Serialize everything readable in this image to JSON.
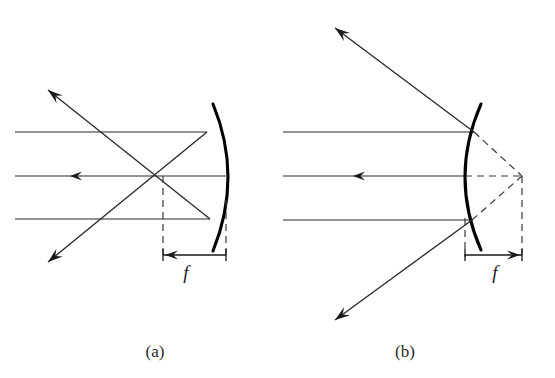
{
  "figure": {
    "background_color": "#ffffff",
    "ink_color": "#1a1a1a",
    "width": 555,
    "height": 378
  },
  "panels": [
    {
      "id": "a",
      "caption": "(a)",
      "caption_x": 155,
      "caption_y": 357,
      "mirror_type": "concave",
      "focal_label": "f",
      "focal_label_x": 186,
      "focal_label_y": 279,
      "focus_x": 163,
      "focus_y": 176,
      "vertex_x": 226,
      "vertex_y": 176,
      "mirror_top": {
        "x": 213,
        "y": 104
      },
      "mirror_bottom": {
        "x": 213,
        "y": 251
      },
      "mirror_control": {
        "x": 243,
        "y": 177
      },
      "axis_y": 176,
      "ray_start_x": 15,
      "incoming_rays": [
        {
          "y": 132,
          "hit_x": 207,
          "hit_y": 132
        },
        {
          "y": 176,
          "hit_x": 226,
          "hit_y": 176
        },
        {
          "y": 219,
          "hit_x": 210,
          "hit_y": 219
        }
      ],
      "incoming_arrow": {
        "x": 70,
        "y": 176,
        "direction": "left"
      },
      "reflected_rays": [
        {
          "from_x": 207,
          "from_y": 132,
          "to_x": 48,
          "to_y": 262,
          "arrow": "lower-left"
        },
        {
          "from_x": 210,
          "from_y": 219,
          "to_x": 48,
          "to_y": 90,
          "arrow": "upper-left"
        }
      ],
      "dimension": {
        "left_x": 163,
        "right_x": 226,
        "y": 255,
        "arrow_direction": "left",
        "dash_top_left_y": 176,
        "dash_top_right_y": 200
      }
    },
    {
      "id": "b",
      "caption": "(b)",
      "caption_x": 405,
      "caption_y": 357,
      "mirror_type": "convex",
      "focal_label": "f",
      "focal_label_x": 495,
      "focal_label_y": 279,
      "focus_x": 522,
      "focus_y": 176,
      "vertex_x": 465,
      "vertex_y": 176,
      "mirror_top": {
        "x": 481,
        "y": 104
      },
      "mirror_bottom": {
        "x": 481,
        "y": 250
      },
      "mirror_control": {
        "x": 449,
        "y": 177
      },
      "axis_y": 176,
      "ray_start_x": 283,
      "incoming_rays": [
        {
          "y": 132,
          "hit_x": 474,
          "hit_y": 132
        },
        {
          "y": 176,
          "hit_x": 465,
          "hit_y": 176
        },
        {
          "y": 220,
          "hit_x": 472,
          "hit_y": 220
        }
      ],
      "incoming_arrow": {
        "x": 353,
        "y": 176,
        "direction": "left"
      },
      "reflected_rays": [
        {
          "from_x": 474,
          "from_y": 132,
          "to_x": 335,
          "to_y": 28,
          "arrow": "upper-left"
        },
        {
          "from_x": 472,
          "from_y": 220,
          "to_x": 335,
          "to_y": 320,
          "arrow": "lower-left"
        }
      ],
      "virtual_extensions": [
        {
          "from_x": 474,
          "from_y": 132,
          "to_x": 522,
          "to_y": 176
        },
        {
          "from_x": 472,
          "from_y": 220,
          "to_x": 522,
          "to_y": 176
        },
        {
          "from_x": 465,
          "from_y": 176,
          "to_x": 522,
          "to_y": 176
        }
      ],
      "dimension": {
        "left_x": 465,
        "right_x": 522,
        "y": 255,
        "arrow_direction": "right",
        "dash_top_left_y": 218,
        "dash_top_right_y": 176
      }
    }
  ]
}
